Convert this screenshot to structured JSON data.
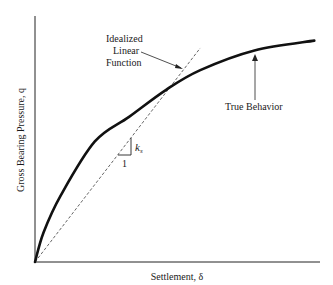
{
  "chart_data": {
    "type": "line",
    "title": "",
    "xlabel": "Settlement, δ",
    "ylabel": "Gross Bearing Pressure, q",
    "xlim": [
      0,
      1
    ],
    "ylim": [
      0,
      1
    ],
    "grid": false,
    "ticks": "none",
    "series": [
      {
        "name": "True Behavior",
        "style": "solid-thick",
        "color": "#111111",
        "x": [
          0,
          0.03,
          0.09,
          0.21,
          0.33,
          0.46,
          0.58,
          0.77,
          0.98
        ],
        "y": [
          0,
          0.12,
          0.27,
          0.49,
          0.59,
          0.7,
          0.78,
          0.86,
          0.9
        ]
      },
      {
        "name": "Idealized Linear Function",
        "style": "dashed",
        "color": "#555555",
        "x": [
          0,
          0.58
        ],
        "y": [
          0,
          0.87
        ]
      }
    ],
    "annotations": {
      "linear_label": [
        "Idealized",
        "Linear",
        "Function"
      ],
      "true_label": "True Behavior",
      "slope_symbol": "k",
      "slope_subscript": "s",
      "slope_run": "1"
    }
  }
}
